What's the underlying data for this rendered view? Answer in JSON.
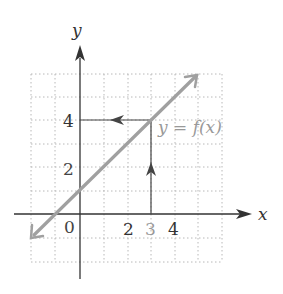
{
  "diagram": {
    "axes": {
      "x_label": "x",
      "y_label": "y"
    },
    "x_ticks": [
      {
        "value": 0,
        "label": "0",
        "color": "#333333"
      },
      {
        "value": 2,
        "label": "2",
        "color": "#333333"
      },
      {
        "value": 3,
        "label": "3",
        "color": "#999999"
      },
      {
        "value": 4,
        "label": "4",
        "color": "#333333"
      }
    ],
    "y_ticks": [
      {
        "value": 2,
        "label": "2"
      },
      {
        "value": 4,
        "label": "4"
      }
    ],
    "function_label": "y = f(x)",
    "line": {
      "description": "y = x + 1",
      "color": "#a0a0a0"
    },
    "mapping": {
      "input": 3,
      "output": 4
    }
  },
  "labels": {
    "x_axis": "x",
    "y_axis": "y",
    "origin": "0",
    "xtick_2": "2",
    "xtick_3": "3",
    "xtick_4": "4",
    "ytick_2": "2",
    "ytick_4": "4",
    "function": "y = f(x)"
  }
}
